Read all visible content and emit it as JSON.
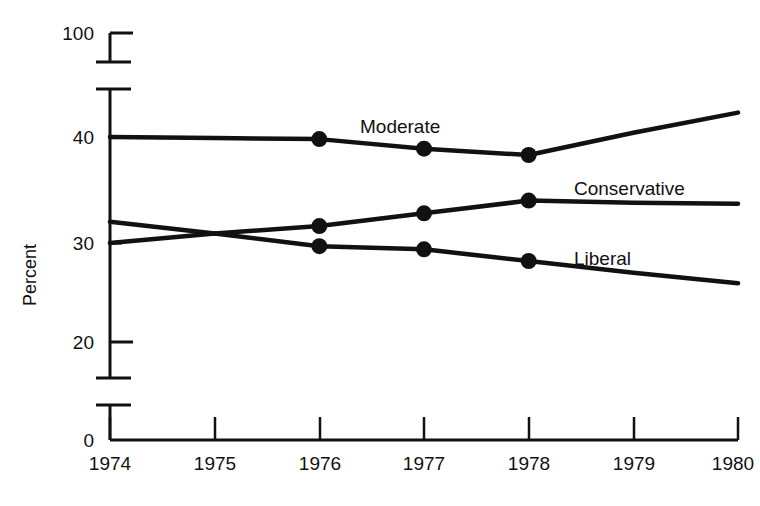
{
  "chart_data": {
    "type": "line",
    "title": "",
    "subtitle": "",
    "xlabel": "",
    "ylabel": "Percent",
    "x": [
      1974,
      1975,
      1976,
      1977,
      1978,
      1979,
      1980
    ],
    "xtick_labels": [
      "1974",
      "1975",
      "1976",
      "1977",
      "1978",
      "1979",
      "1980"
    ],
    "ytick_labels": [
      "0",
      "20",
      "30",
      "40",
      "100"
    ],
    "ytick_values": [
      0,
      20,
      30,
      40,
      100
    ],
    "xlim": [
      1974,
      1980
    ],
    "ylim": [
      0,
      100
    ],
    "grid": false,
    "legend_position": "inline-right",
    "axis_breaks": [
      "between 0 and 20",
      "between 40 and 100"
    ],
    "marker_years": [
      1976,
      1977,
      1978
    ],
    "series": [
      {
        "name": "Moderate",
        "values": [
          40.0,
          39.9,
          39.8,
          38.9,
          38.3,
          40.4,
          42.3
        ],
        "markers": [
          39.8,
          38.9,
          38.3
        ]
      },
      {
        "name": "Conservative",
        "values": [
          32.0,
          30.9,
          31.6,
          32.8,
          34.0,
          33.8,
          33.7
        ],
        "markers": [
          31.6,
          32.8,
          34.0
        ]
      },
      {
        "name": "Liberal",
        "values": [
          30.0,
          30.9,
          29.7,
          29.4,
          28.3,
          27.2,
          26.2
        ],
        "markers": [
          29.7,
          29.4,
          28.3
        ]
      }
    ],
    "colors": {
      "line": "#111111",
      "marker": "#111111",
      "axis": "#111111",
      "background": "#ffffff"
    }
  },
  "axis": {
    "y_title": "Percent",
    "y_ticks": [
      {
        "label": "100"
      },
      {
        "label": "40"
      },
      {
        "label": "30"
      },
      {
        "label": "20"
      },
      {
        "label": "0"
      }
    ],
    "x_ticks": [
      {
        "label": "1974"
      },
      {
        "label": "1975"
      },
      {
        "label": "1976"
      },
      {
        "label": "1977"
      },
      {
        "label": "1978"
      },
      {
        "label": "1979"
      },
      {
        "label": "1980"
      }
    ]
  },
  "series_labels": [
    {
      "text": "Moderate"
    },
    {
      "text": "Conservative"
    },
    {
      "text": "Liberal"
    }
  ]
}
